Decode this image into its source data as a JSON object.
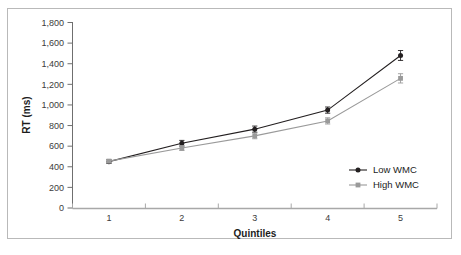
{
  "figure": {
    "border_color": "#b9b9b9",
    "background": "#ffffff"
  },
  "chart_data": {
    "type": "line",
    "title": "",
    "xlabel": "Quintiles",
    "ylabel": "RT (ms)",
    "categories": [
      "1",
      "2",
      "3",
      "4",
      "5"
    ],
    "x": [
      1,
      2,
      3,
      4,
      5
    ],
    "ylim": [
      0,
      1800
    ],
    "yticks": [
      0,
      200,
      400,
      600,
      800,
      1000,
      1200,
      1400,
      1600,
      1800
    ],
    "ytick_labels": [
      "0",
      "200",
      "400",
      "600",
      "800",
      "1,000",
      "1,200",
      "1,400",
      "1,600",
      "1,800"
    ],
    "xtick_labels": [
      "1",
      "2",
      "3",
      "4",
      "5"
    ],
    "grid": false,
    "legend_position": "right-lower",
    "series": [
      {
        "name": "Low WMC",
        "color": "#231f20",
        "marker": "circle",
        "values": [
          450,
          628,
          765,
          950,
          1480
        ],
        "errors": [
          18,
          28,
          30,
          30,
          48
        ]
      },
      {
        "name": "High WMC",
        "color": "#9a9a9a",
        "marker": "square",
        "values": [
          455,
          582,
          700,
          845,
          1258
        ],
        "errors": [
          16,
          24,
          28,
          30,
          45
        ]
      }
    ]
  },
  "legend": {
    "items": [
      {
        "label": "Low WMC",
        "color": "#231f20",
        "marker": "circle"
      },
      {
        "label": "High WMC",
        "color": "#9a9a9a",
        "marker": "square"
      }
    ]
  },
  "axes": {
    "y_title": "RT (ms)",
    "x_title": "Quintiles"
  }
}
